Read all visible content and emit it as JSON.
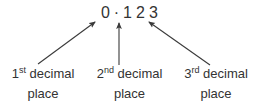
{
  "figure": {
    "background_color": "#ffffff",
    "text_color": "#333333"
  },
  "number": {
    "whole_part": "0",
    "separator": "·",
    "digits": [
      {
        "value": "1",
        "place_index": 1
      },
      {
        "value": "2",
        "place_index": 2
      },
      {
        "value": "3",
        "place_index": 3
      }
    ],
    "full_text": "0 · 1 2 3"
  },
  "labels": [
    {
      "ordinal_number": "1",
      "ordinal_suffix": "st",
      "word": "decimal",
      "line2": "place",
      "full_text": "1st decimal place"
    },
    {
      "ordinal_number": "2",
      "ordinal_suffix": "nd",
      "word": "decimal",
      "line2": "place",
      "full_text": "2nd decimal place"
    },
    {
      "ordinal_number": "3",
      "ordinal_suffix": "rd",
      "word": "decimal",
      "line2": "place",
      "full_text": "3rd decimal place"
    }
  ],
  "arrows": [
    {
      "name": "arrow-to-first-decimal",
      "direction": "up-right",
      "from_x": 38,
      "from_y": 64,
      "to_x": 96,
      "to_y": 21,
      "color": "#3a3a3a"
    },
    {
      "name": "arrow-to-second-decimal",
      "direction": "up",
      "from_x": 119,
      "from_y": 65,
      "to_x": 119,
      "to_y": 21,
      "color": "#3a3a3a"
    },
    {
      "name": "arrow-to-third-decimal",
      "direction": "up-left",
      "from_x": 210,
      "from_y": 65,
      "to_x": 148,
      "to_y": 21,
      "color": "#3a3a3a"
    }
  ]
}
